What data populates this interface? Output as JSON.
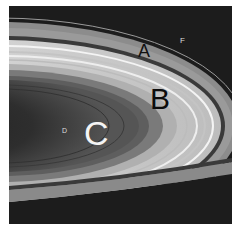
{
  "image": {
    "subject": "Saturn's rings",
    "labels": {
      "a": "A",
      "b": "B",
      "c": "C",
      "d": "D",
      "f": "F"
    },
    "colors": {
      "space": "#1c1c1c",
      "a_ring": "#8a8a8a",
      "cassini_division": "#3a3a3a",
      "b_ring": "#d8d8d8",
      "c_ring": "#5a5a5a",
      "d_region": "#2a2a2a"
    }
  }
}
